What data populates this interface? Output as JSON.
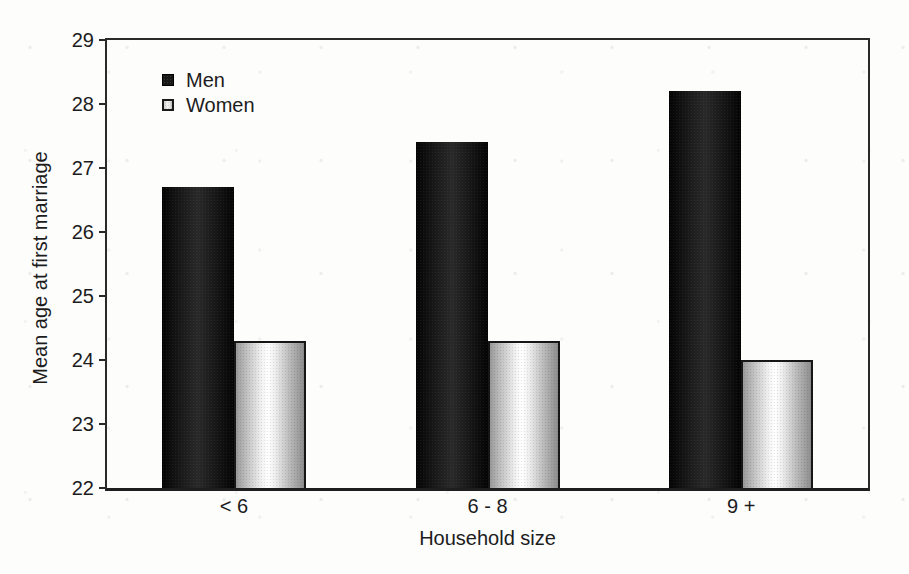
{
  "figure": {
    "background_color": "#fdfdfc",
    "ink_color": "#1c1c1c",
    "men_bar_color": "#161616",
    "women_bar_color": "#e8e8e8"
  },
  "chart_data": {
    "type": "bar",
    "title": "",
    "xlabel": "Household size",
    "ylabel": "Mean age at first marriage",
    "categories": [
      "< 6",
      "6 - 8",
      "9 +"
    ],
    "series": [
      {
        "name": "Men",
        "values": [
          26.7,
          27.4,
          28.2
        ],
        "color": "#161616"
      },
      {
        "name": "Women",
        "values": [
          24.3,
          24.3,
          24.0
        ],
        "color": "#e8e8e8"
      }
    ],
    "ylim": [
      22,
      29
    ],
    "yticks": [
      22,
      23,
      24,
      25,
      26,
      27,
      28,
      29
    ],
    "grid": false,
    "legend_position": "upper-left-inside"
  }
}
